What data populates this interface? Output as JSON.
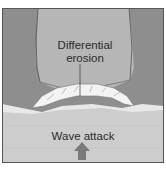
{
  "diagram": {
    "labels": {
      "differential_erosion_line1": "Differential",
      "differential_erosion_line2": "erosion",
      "wave_attack": "Wave attack"
    },
    "colors": {
      "outer_rock": "#8c8c8c",
      "headland": "#b4b4b4",
      "broken_rock": "#f2f2f2",
      "sea": "#cfcfcf",
      "arrow": "#7a7a7a",
      "border": "#555555"
    }
  }
}
